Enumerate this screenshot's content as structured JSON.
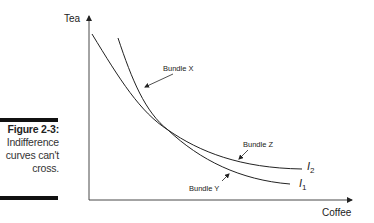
{
  "caption": {
    "figure_label": "Figure 2-3:",
    "text_line1": "Indifference",
    "text_line2": "curves can't",
    "text_line3": "cross."
  },
  "diagram": {
    "y_axis_label": "Tea",
    "x_axis_label": "Coffee",
    "curves": [
      {
        "name": "I1",
        "label_main": "I",
        "label_sub": "1"
      },
      {
        "name": "I2",
        "label_main": "I",
        "label_sub": "2"
      }
    ],
    "annotations": [
      {
        "id": "bundle-x",
        "text": "Bundle X"
      },
      {
        "id": "bundle-y",
        "text": "Bundle Y"
      },
      {
        "id": "bundle-z",
        "text": "Bundle Z"
      }
    ]
  },
  "colors": {
    "ink": "#222222",
    "bar": "#111111",
    "background": "#ffffff"
  }
}
